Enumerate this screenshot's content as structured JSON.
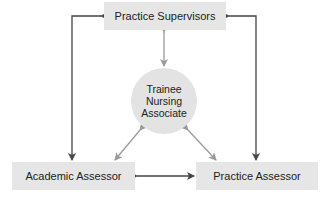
{
  "diagram": {
    "nodes": {
      "practice_supervisors": "Practice Supervisors",
      "trainee": {
        "line1": "Trainee",
        "line2": "Nursing",
        "line3": "Associate"
      },
      "academic_assessor": "Academic Assessor",
      "practice_assessor": "Practice Assessor"
    },
    "edges": [
      {
        "from": "Practice Supervisors",
        "to": "Trainee Nursing Associate",
        "direction": "bidirectional",
        "style": "light"
      },
      {
        "from": "Trainee Nursing Associate",
        "to": "Academic Assessor",
        "direction": "bidirectional",
        "style": "light"
      },
      {
        "from": "Trainee Nursing Associate",
        "to": "Practice Assessor",
        "direction": "bidirectional",
        "style": "light"
      },
      {
        "from": "Academic Assessor",
        "to": "Practice Assessor",
        "direction": "bidirectional",
        "style": "dark"
      },
      {
        "from": "Academic Assessor",
        "to": "Practice Supervisors",
        "direction": "bidirectional",
        "style": "dark",
        "routing": "left elbow"
      },
      {
        "from": "Practice Assessor",
        "to": "Practice Supervisors",
        "direction": "bidirectional",
        "style": "dark",
        "routing": "right elbow"
      }
    ],
    "colors": {
      "box_fill": "#e6e6e6",
      "circle_fill": "#e3e3e3",
      "dark_arrow": "#444444",
      "light_arrow": "#9a9a9a",
      "text": "#222222"
    }
  }
}
